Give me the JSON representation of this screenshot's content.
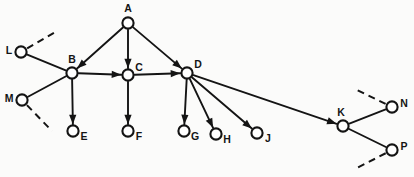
{
  "figure": {
    "background_color": "#fbfbfa",
    "ink_color": "#141414",
    "width": 414,
    "height": 177
  },
  "nodes": [
    {
      "id": "A",
      "label": "A",
      "cx": 128,
      "cy": 23,
      "r": 5.6,
      "label_x": 128,
      "label_y": 9,
      "anchor": "middle"
    },
    {
      "id": "B",
      "label": "B",
      "cx": 72,
      "cy": 73,
      "r": 5.6,
      "label_x": 72,
      "label_y": 60,
      "anchor": "middle"
    },
    {
      "id": "C",
      "label": "C",
      "cx": 128,
      "cy": 75,
      "r": 5.6,
      "label_x": 139,
      "label_y": 68,
      "anchor": "middle"
    },
    {
      "id": "D",
      "label": "D",
      "cx": 187,
      "cy": 73,
      "r": 5.6,
      "label_x": 198,
      "label_y": 65,
      "anchor": "middle"
    },
    {
      "id": "E",
      "label": "E",
      "cx": 73,
      "cy": 131,
      "r": 5.6,
      "label_x": 84,
      "label_y": 137,
      "anchor": "middle"
    },
    {
      "id": "F",
      "label": "F",
      "cx": 128,
      "cy": 131,
      "r": 5.6,
      "label_x": 139,
      "label_y": 137,
      "anchor": "middle"
    },
    {
      "id": "G",
      "label": "G",
      "cx": 184,
      "cy": 131,
      "r": 5.6,
      "label_x": 195,
      "label_y": 137,
      "anchor": "middle"
    },
    {
      "id": "H",
      "label": "H",
      "cx": 216,
      "cy": 134,
      "r": 5.6,
      "label_x": 227,
      "label_y": 140,
      "anchor": "middle"
    },
    {
      "id": "J",
      "label": "J",
      "cx": 257,
      "cy": 133,
      "r": 5.6,
      "label_x": 268,
      "label_y": 139,
      "anchor": "middle"
    },
    {
      "id": "K",
      "label": "K",
      "cx": 343,
      "cy": 126,
      "r": 5.6,
      "label_x": 341,
      "label_y": 113,
      "anchor": "middle"
    },
    {
      "id": "L",
      "label": "L",
      "cx": 21,
      "cy": 52,
      "r": 5.6,
      "label_x": 9,
      "label_y": 51,
      "anchor": "middle"
    },
    {
      "id": "M",
      "label": "M",
      "cx": 22,
      "cy": 100,
      "r": 5.6,
      "label_x": 9,
      "label_y": 99,
      "anchor": "middle"
    },
    {
      "id": "N",
      "label": "N",
      "cx": 392,
      "cy": 107,
      "r": 5.6,
      "label_x": 404,
      "label_y": 104,
      "anchor": "middle"
    },
    {
      "id": "P",
      "label": "P",
      "cx": 392,
      "cy": 150,
      "r": 5.6,
      "label_x": 404,
      "label_y": 147,
      "anchor": "middle"
    }
  ],
  "edges": [
    {
      "id": "A-B",
      "from": "A",
      "to": "B",
      "style": "solid",
      "arrow": true
    },
    {
      "id": "A-C",
      "from": "A",
      "to": "C",
      "style": "solid",
      "arrow": true
    },
    {
      "id": "A-D",
      "from": "A",
      "to": "D",
      "style": "solid",
      "arrow": true
    },
    {
      "id": "B-C",
      "from": "B",
      "to": "C",
      "style": "solid",
      "arrow": true
    },
    {
      "id": "C-D",
      "from": "C",
      "to": "D",
      "style": "solid",
      "arrow": true
    },
    {
      "id": "B-E",
      "from": "B",
      "to": "E",
      "style": "solid",
      "arrow": true
    },
    {
      "id": "C-F",
      "from": "C",
      "to": "F",
      "style": "solid",
      "arrow": true
    },
    {
      "id": "D-G",
      "from": "D",
      "to": "G",
      "style": "solid",
      "arrow": true
    },
    {
      "id": "D-H",
      "from": "D",
      "to": "H",
      "style": "solid",
      "arrow": true
    },
    {
      "id": "D-J",
      "from": "D",
      "to": "J",
      "style": "solid",
      "arrow": true
    },
    {
      "id": "D-K",
      "from": "D",
      "to": "K",
      "style": "solid",
      "arrow": true
    },
    {
      "id": "L-B",
      "from": "L",
      "to": "B",
      "style": "solid",
      "arrow": false
    },
    {
      "id": "M-B",
      "from": "M",
      "to": "B",
      "style": "solid",
      "arrow": false
    },
    {
      "id": "K-N",
      "from": "K",
      "to": "N",
      "style": "solid",
      "arrow": false
    },
    {
      "id": "K-P",
      "from": "K",
      "to": "P",
      "style": "solid",
      "arrow": false
    }
  ],
  "dangling_edges": [
    {
      "id": "L-upper-dashed",
      "from": "L",
      "x2": 57,
      "y2": 31,
      "style": "dashed"
    },
    {
      "id": "M-lower-dashed",
      "from": "M",
      "x2": 52,
      "y2": 131,
      "style": "dashed"
    },
    {
      "id": "N-upper-dashed",
      "from": "N",
      "x2": 357,
      "y2": 90,
      "style": "dashed"
    },
    {
      "id": "P-lower-dashed",
      "from": "P",
      "x2": 357,
      "y2": 168,
      "style": "dashed"
    }
  ]
}
